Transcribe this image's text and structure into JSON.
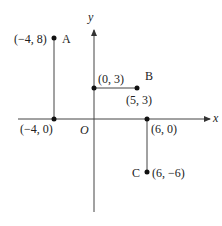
{
  "diagram": {
    "axes": {
      "x_label": "x",
      "y_label": "y",
      "origin_label": "O"
    },
    "points": [
      {
        "id": "A",
        "coord_label": "(−4, 8)",
        "x": -4,
        "y": 8
      },
      {
        "id": "B",
        "coord_label": "(5, 3)",
        "x": 5,
        "y": 3
      },
      {
        "id": "C",
        "coord_label": "(6, −6)",
        "x": 6,
        "y": -6
      },
      {
        "id": "",
        "coord_label": "(0, 3)",
        "x": 0,
        "y": 3
      },
      {
        "id": "",
        "coord_label": "(−4, 0)",
        "x": -4,
        "y": 0
      },
      {
        "id": "",
        "coord_label": "(6, 0)",
        "x": 6,
        "y": 0
      }
    ],
    "labels": {
      "A": "A",
      "B": "B",
      "C": "C",
      "pA": "(−4, 8)",
      "pB": "(5, 3)",
      "pC": "(6, −6)",
      "p03": "(0, 3)",
      "pm40": "(−4, 0)",
      "p60": "(6, 0)"
    },
    "segments": [
      {
        "from": [
          -4,
          8
        ],
        "to": [
          -4,
          0
        ]
      },
      {
        "from": [
          0,
          3
        ],
        "to": [
          5,
          3
        ]
      },
      {
        "from": [
          6,
          0
        ],
        "to": [
          6,
          -6
        ]
      }
    ]
  }
}
